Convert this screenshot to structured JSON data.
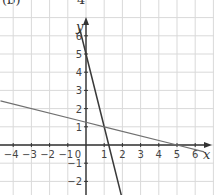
{
  "header": {
    "fragment_left": "(b)",
    "fragment_frac": "4",
    "fragment_right": "[x-axis]"
  },
  "chart_data": {
    "type": "line",
    "title": "",
    "xlabel": "x",
    "ylabel": "y",
    "xlim": [
      -4.7,
      6.5
    ],
    "ylim": [
      -2.8,
      7
    ],
    "grid": true,
    "x_ticks": [
      -4,
      -3,
      -2,
      -1,
      1,
      2,
      3,
      4,
      5,
      6
    ],
    "y_ticks": [
      -2,
      -1,
      1,
      2,
      3,
      4,
      5,
      6
    ],
    "origin_label": "0",
    "series": [
      {
        "name": "steep line",
        "equation": "y = -4x + 5",
        "points": [
          [
            -0.35,
            6.4
          ],
          [
            0,
            5
          ],
          [
            1,
            1
          ],
          [
            1.25,
            0
          ],
          [
            1.95,
            -2.8
          ]
        ]
      },
      {
        "name": "shallow line",
        "equation": "y = -x/4 + 1.25",
        "points": [
          [
            -4.7,
            2.425
          ],
          [
            0,
            1.25
          ],
          [
            1,
            1
          ],
          [
            5,
            0
          ],
          [
            6.5,
            -0.375
          ]
        ]
      }
    ],
    "intersection": [
      1,
      1
    ]
  }
}
